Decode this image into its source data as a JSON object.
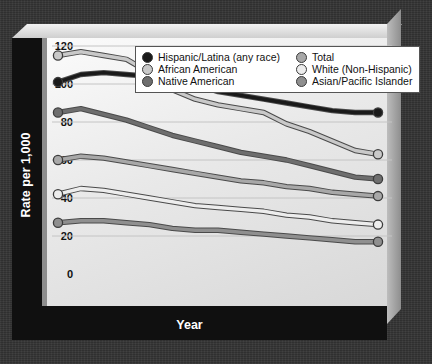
{
  "axis_titles": {
    "y": "Rate per 1,000",
    "x": "Year"
  },
  "legend": {
    "entries": [
      {
        "label": "Hispanic/Latina (any race)",
        "color": "#1a1a1a"
      },
      {
        "label": "Total",
        "color": "#a8a8a8"
      },
      {
        "label": "African American",
        "color": "#c9c9c9"
      },
      {
        "label": "White (Non-Hispanic)",
        "color": "#ededed"
      },
      {
        "label": "Native American",
        "color": "#6e6e6e"
      },
      {
        "label": "Asian/Pacific Islander",
        "color": "#8f8f8f"
      }
    ]
  },
  "chart_data": {
    "type": "line",
    "title": "",
    "xlabel": "Year",
    "ylabel": "Rate per 1,000",
    "xlim": [
      1990,
      2004
    ],
    "ylim": [
      0,
      120
    ],
    "yticks": [
      0,
      20,
      40,
      60,
      80,
      100,
      120
    ],
    "grid": true,
    "legend_position": "top",
    "x": [
      1990,
      1991,
      1992,
      1993,
      1994,
      1995,
      1996,
      1997,
      1998,
      1999,
      2000,
      2001,
      2002,
      2003,
      2004
    ],
    "series": [
      {
        "name": "Hispanic/Latina (any race)",
        "color": "#1a1a1a",
        "values": [
          101,
          105,
          106,
          105,
          104,
          104,
          100,
          96,
          94,
          92,
          90,
          88,
          86,
          85,
          85
        ]
      },
      {
        "name": "African American",
        "color": "#c9c9c9",
        "values": [
          115,
          117,
          115,
          113,
          106,
          97,
          92,
          89,
          87,
          85,
          79,
          75,
          70,
          65,
          63
        ]
      },
      {
        "name": "Native American",
        "color": "#6e6e6e",
        "values": [
          85,
          87,
          84,
          81,
          77,
          73,
          70,
          67,
          64,
          62,
          60,
          57,
          54,
          51,
          50
        ]
      },
      {
        "name": "Total",
        "color": "#a8a8a8",
        "values": [
          60,
          62,
          61,
          59,
          57,
          55,
          53,
          51,
          49,
          48,
          46,
          45,
          43,
          42,
          41
        ]
      },
      {
        "name": "White (Non-Hispanic)",
        "color": "#ededed",
        "values": [
          42,
          45,
          44,
          42,
          40,
          38,
          36,
          35,
          34,
          33,
          31,
          30,
          28,
          27,
          26
        ]
      },
      {
        "name": "Asian/Pacific Islander",
        "color": "#8f8f8f",
        "values": [
          27,
          28,
          28,
          27,
          26,
          24,
          23,
          23,
          22,
          21,
          20,
          19,
          18,
          17,
          17
        ]
      }
    ]
  }
}
